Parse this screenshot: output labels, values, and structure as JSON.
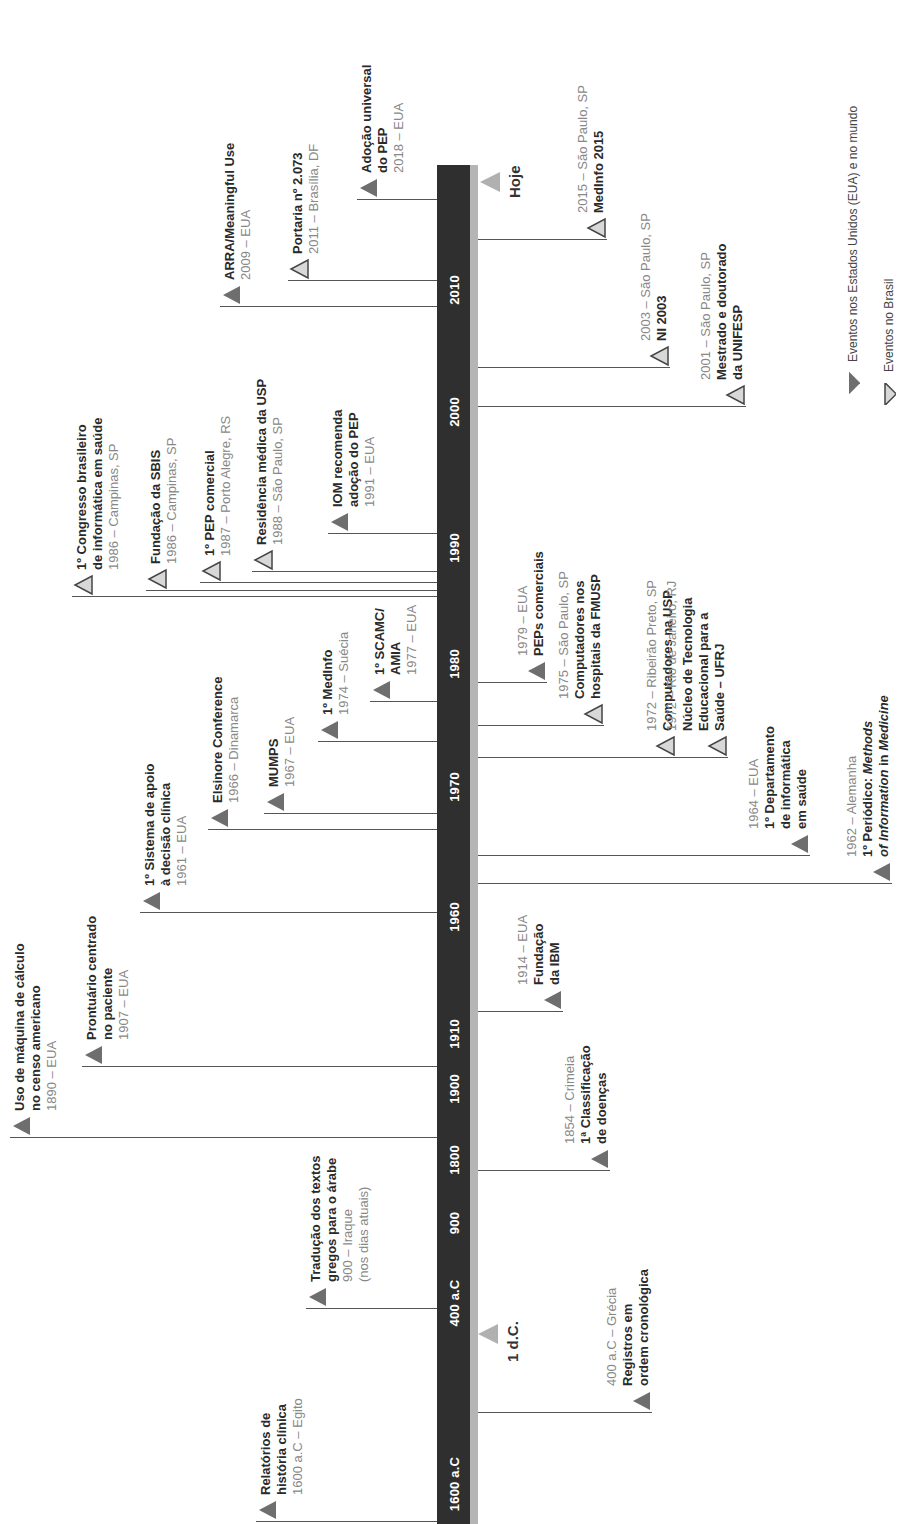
{
  "colors": {
    "bar": "#2f2f2f",
    "bar_edge": "#b5b5b5",
    "usa_world_marker": "#6e6e6e",
    "brazil_marker_fill": "#d8d8d8",
    "brazil_marker_stroke": "#444444",
    "now_marker": "#b0b0b0",
    "title_text": "#2a2a2a",
    "subtitle_text": "#888888"
  },
  "axis": {
    "ticks": [
      {
        "label": "2010",
        "y": 290
      },
      {
        "label": "2000",
        "y": 412
      },
      {
        "label": "1990",
        "y": 548
      },
      {
        "label": "1980",
        "y": 664
      },
      {
        "label": "1970",
        "y": 787
      },
      {
        "label": "1960",
        "y": 917
      },
      {
        "label": "1910",
        "y": 1034
      },
      {
        "label": "1900",
        "y": 1089
      },
      {
        "label": "1800",
        "y": 1160
      },
      {
        "label": "900",
        "y": 1223
      },
      {
        "label": "400 a.C",
        "y": 1303
      },
      {
        "label": "1600 a.C",
        "y": 1484
      }
    ],
    "now_label": "Hoje",
    "ad_label": "1 d.C."
  },
  "legend": {
    "usa_world": "Eventos nos Estados Unidos (EUA) e no mundo",
    "brazil": "Eventos no Brasil"
  },
  "events_left": [
    {
      "id": "e2018",
      "type": "world",
      "title": [
        "Adoção universal",
        "do PEP"
      ],
      "sub": [
        "2018 – EUA"
      ],
      "line_y": 199,
      "x": 357
    },
    {
      "id": "e2011",
      "type": "brazil",
      "title": [
        "Portaria nº 2.073"
      ],
      "sub": [
        "2011 – Brasília, DF"
      ],
      "line_y": 280,
      "x": 288
    },
    {
      "id": "e2009",
      "type": "world",
      "title": [
        "ARRA/Meaningful Use"
      ],
      "sub": [
        "2009 – EUA"
      ],
      "line_y": 306,
      "x": 220
    },
    {
      "id": "e1991",
      "type": "world",
      "title": [
        "IOM recomenda",
        "adoção do PEP"
      ],
      "sub": [
        "1991 – EUA"
      ],
      "line_y": 533,
      "x": 328
    },
    {
      "id": "e1988",
      "type": "brazil",
      "title": [
        "Residência médica da USP"
      ],
      "sub": [
        "1988 – São Paulo, SP"
      ],
      "line_y": 571,
      "x": 252
    },
    {
      "id": "e1987",
      "type": "brazil",
      "title": [
        "1º PEP comercial"
      ],
      "sub": [
        "1987 – Porto Alegre, RS"
      ],
      "line_y": 582,
      "x": 200
    },
    {
      "id": "e1986b",
      "type": "brazil",
      "title": [
        "Fundação da SBIS"
      ],
      "sub": [
        "1986 – Campinas, SP"
      ],
      "line_y": 590,
      "x": 146
    },
    {
      "id": "e1986a",
      "type": "brazil",
      "title": [
        "1º Congresso brasileiro",
        "de informática em saúde"
      ],
      "sub": [
        "1986 – Campinas, SP"
      ],
      "line_y": 596,
      "x": 72
    },
    {
      "id": "e1977",
      "type": "world",
      "title": [
        "1º SCAMC/",
        "AMIA"
      ],
      "sub": [
        "1977 – EUA"
      ],
      "line_y": 701,
      "x": 370
    },
    {
      "id": "e1974",
      "type": "world",
      "title": [
        "1º MedInfo"
      ],
      "sub": [
        "1974 – Suécia"
      ],
      "line_y": 741,
      "x": 318
    },
    {
      "id": "e1967",
      "type": "world",
      "title": [
        "MUMPS"
      ],
      "sub": [
        "1967 – EUA"
      ],
      "line_y": 813,
      "x": 264
    },
    {
      "id": "e1966",
      "type": "world",
      "title": [
        "Elsinore Conference"
      ],
      "sub": [
        "1966 – Dinamarca"
      ],
      "line_y": 829,
      "x": 208
    },
    {
      "id": "e1961",
      "type": "world",
      "title": [
        "1º Sistema de apoio",
        "à decisão clínica"
      ],
      "sub": [
        "1961 – EUA"
      ],
      "line_y": 912,
      "x": 140
    },
    {
      "id": "e1907",
      "type": "world",
      "title": [
        "Prontuário centrado",
        "no paciente"
      ],
      "sub": [
        "1907 – EUA"
      ],
      "line_y": 1066,
      "x": 82
    },
    {
      "id": "e1890",
      "type": "world",
      "title": [
        "Uso de máquina de cálculo",
        "no censo americano"
      ],
      "sub": [
        "1890 – EUA"
      ],
      "line_y": 1137,
      "x": 10
    },
    {
      "id": "e900",
      "type": "world",
      "title": [
        "Tradução dos textos",
        "gregos para o árabe"
      ],
      "sub": [
        "900 – Iraque",
        "(nos dias atuais)"
      ],
      "line_y": 1308,
      "x": 306
    },
    {
      "id": "e1600ac",
      "type": "world",
      "title": [
        "Relatórios de",
        "história clínica"
      ],
      "sub": [
        "1600 a.C – Egito"
      ],
      "line_y": 1521,
      "x": 256
    }
  ],
  "events_right": [
    {
      "id": "e2015",
      "type": "brazil",
      "sub": [
        "2015 – São Paulo, SP"
      ],
      "title": [
        "MedInfo 2015"
      ],
      "line_y": 239,
      "x": 585
    },
    {
      "id": "e2003",
      "type": "brazil",
      "sub": [
        "2003 – São Paulo, SP"
      ],
      "title": [
        "NI 2003"
      ],
      "line_y": 367,
      "x": 648
    },
    {
      "id": "e2001",
      "type": "brazil",
      "sub": [
        "2001 – São Paulo, SP"
      ],
      "title": [
        "Mestrado e doutorado",
        "da UNIFESP"
      ],
      "line_y": 406,
      "x": 724
    },
    {
      "id": "e1979",
      "type": "world",
      "sub": [
        "1979 – EUA"
      ],
      "title": [
        "PEPs comerciais"
      ],
      "line_y": 682,
      "x": 525
    },
    {
      "id": "e1975",
      "type": "brazil",
      "sub": [
        "1975 – São Paulo, SP"
      ],
      "title": [
        "Computadores nos",
        "hospitais da FMUSP"
      ],
      "line_y": 725,
      "x": 582
    },
    {
      "id": "e1972a",
      "type": "brazil",
      "sub": [
        "1972 – Ribeirão Preto, SP"
      ],
      "title": [
        "Computadores na USP"
      ],
      "line_y": 757,
      "x": 654
    },
    {
      "id": "e1972b",
      "type": "brazil",
      "sub": [
        "1972 – Rio de Janeiro, RJ"
      ],
      "title": [
        "Núcleo de Tecnologia",
        "Educacional para a",
        "Saúde – UFRJ"
      ],
      "line_y": 757,
      "x": 706
    },
    {
      "id": "e1964",
      "type": "world",
      "sub": [
        "1964 – EUA"
      ],
      "title": [
        "1º Departamento",
        "de informática",
        "em saúde"
      ],
      "line_y": 855,
      "x": 788
    },
    {
      "id": "e1962",
      "type": "world",
      "sub": [
        "1962 – Alemanha"
      ],
      "title": [
        "1º Periódico: Methods",
        "of Information in Medicine"
      ],
      "line_y": 883,
      "x": 870
    },
    {
      "id": "e1914",
      "type": "world",
      "sub": [
        "1914 – EUA"
      ],
      "title": [
        "Fundação",
        "da IBM"
      ],
      "line_y": 1011,
      "x": 541
    },
    {
      "id": "e1854",
      "type": "world",
      "sub": [
        "1854 – Crimeia"
      ],
      "title": [
        "1ª Classificação",
        "de doenças"
      ],
      "line_y": 1170,
      "x": 588
    },
    {
      "id": "e400ac",
      "type": "world",
      "sub": [
        "400 a.C – Grécia"
      ],
      "title": [
        "Registros em",
        "ordem cronológica"
      ],
      "line_y": 1412,
      "x": 630
    }
  ]
}
